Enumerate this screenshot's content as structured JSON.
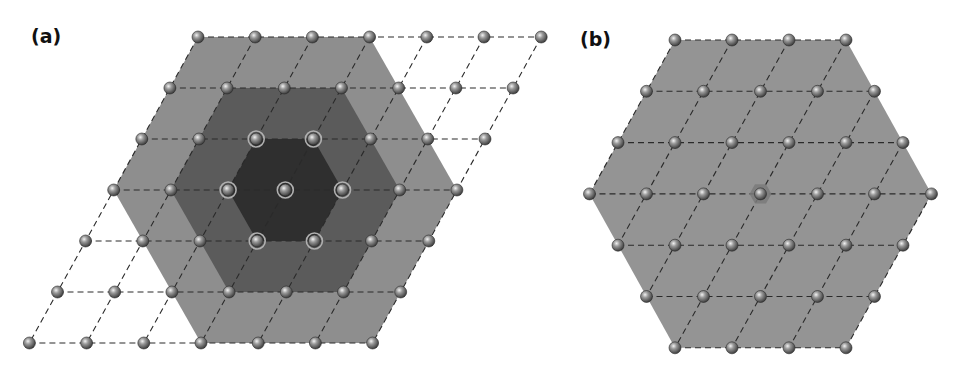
{
  "figure": {
    "panels": [
      {
        "id": "a",
        "label": "(a)",
        "description": "7x7 rhombic lattice with three nested hexagonal shells around a central atom",
        "lattice": {
          "origin": [
            198,
            37
          ],
          "a1": [
            57.2,
            0
          ],
          "a2": [
            -28.1,
            51
          ],
          "rows": 7,
          "cols": 7
        },
        "shells": [
          {
            "name": "outer-shell",
            "radius": 3,
            "color": "#8e8e8e"
          },
          {
            "name": "middle-shell",
            "radius": 2,
            "color": "#5b5b5b"
          },
          {
            "name": "inner-shell",
            "radius": 1,
            "color": "#2f2f2f"
          }
        ],
        "center_index": [
          3,
          3
        ],
        "highlight_ring_radius": 2
      },
      {
        "id": "b",
        "label": "(b)",
        "description": "Hexagonal cluster of radius 3 (37 atoms) with a marked central atom",
        "lattice": {
          "origin": [
            675,
            40
          ],
          "a1": [
            57.0,
            0
          ],
          "a2": [
            -28.5,
            51.3
          ],
          "radius": 3
        },
        "fill_color": "#949494",
        "center_marker": {
          "shape": "hexagon",
          "radius": 11,
          "color": "#7a7a7a"
        }
      }
    ],
    "colors": {
      "background": "#ffffff",
      "dashed_line": "#2a2a2a",
      "atom_dark": "#3c3c3c",
      "atom_mid": "#8a8a8a",
      "atom_light": "#e6e6e6",
      "highlight_ring": "#b0b0b0"
    }
  }
}
